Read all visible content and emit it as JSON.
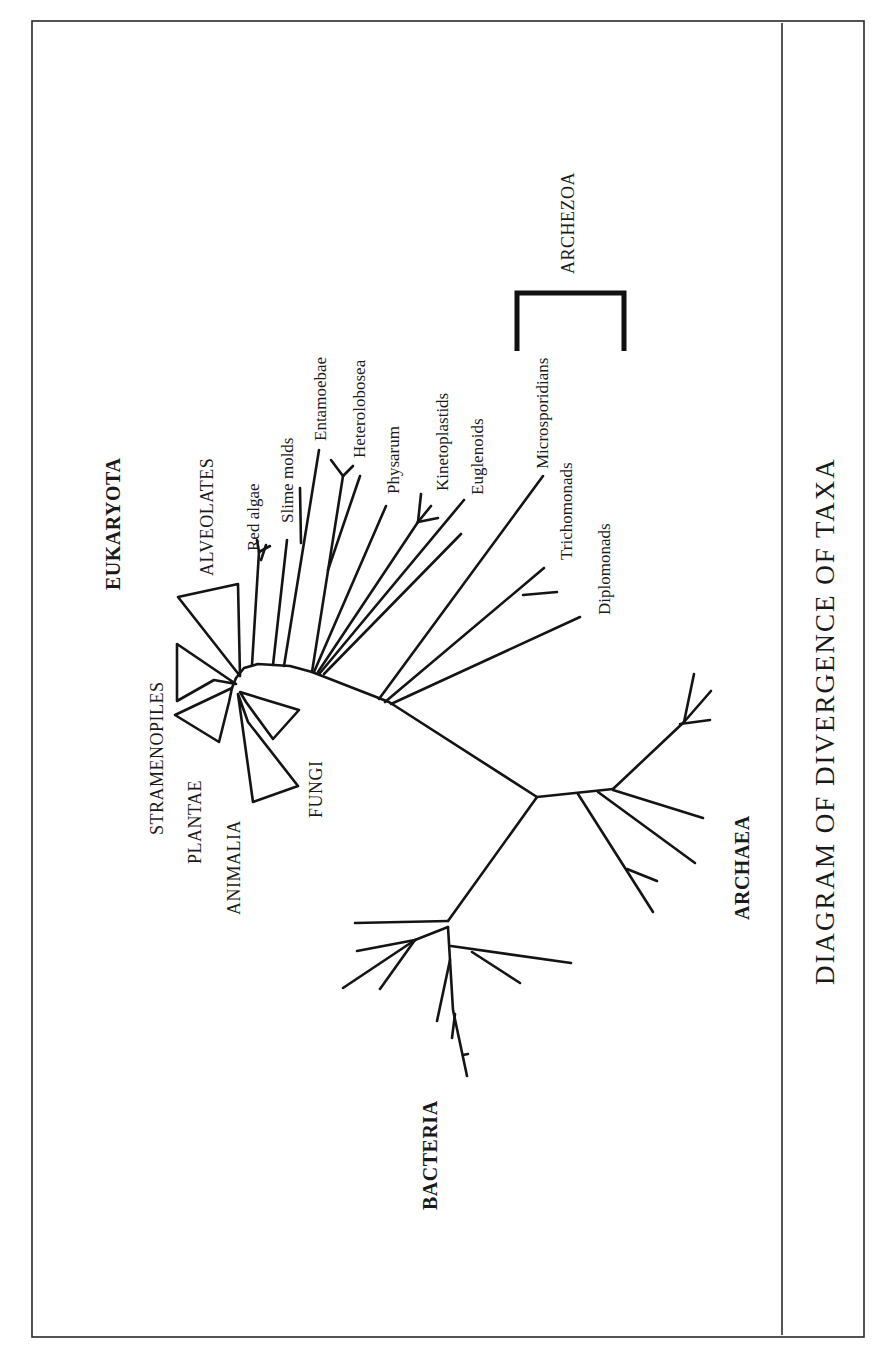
{
  "title": "DIAGRAM OF DIVERGENCE OF TAXA",
  "domains": {
    "eukaryota": "EUKARYOTA",
    "archaea": "ARCHAEA",
    "bacteria": "BACTERIA"
  },
  "groups": {
    "alveolates": "ALVEOLATES",
    "stramenopiles": "STRAMENOPILES",
    "plantae": "PLANTAE",
    "animalia": "ANIMALIA",
    "fungi": "FUNGI",
    "archezoa": "ARCHEZOA"
  },
  "taxa": {
    "red_algae": "Red algae",
    "slime_molds": "Slime molds",
    "entamoebae": "Entamoebae",
    "heterolobosea": "Heterolobosea",
    "physarum": "Physarum",
    "kinetoplastids": "Kinetoplastids",
    "euglenoids": "Euglenoids",
    "microsporidians": "Microsporidians",
    "trichomonads": "Trichomonads",
    "diplomonads": "Diplomonads"
  },
  "colors": {
    "line": "#141414",
    "frame": "#2a2a2a",
    "background": "#ffffff"
  }
}
